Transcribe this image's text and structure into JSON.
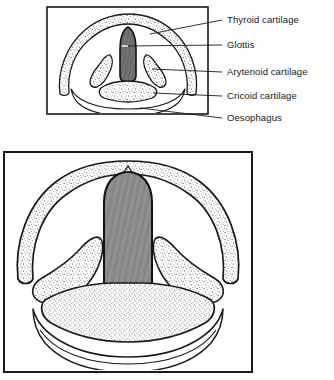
{
  "figure": {
    "background_color": "#ffffff",
    "ink_color": "#1a1a1a",
    "panels": [
      {
        "name": "upper-panel",
        "caption": "small cross-section of larynx with labels",
        "frame": {
          "x": 47,
          "y": 7,
          "width": 161,
          "height": 107
        }
      },
      {
        "name": "lower-panel",
        "caption": "enlarged cross-section of larynx",
        "frame": {
          "x": 4,
          "y": 152,
          "width": 248,
          "height": 220
        }
      }
    ],
    "labels": [
      {
        "id": "thyroid",
        "text": "Thyroid cartilage",
        "x": 227,
        "y": 23,
        "leader_y": 20,
        "leader_to_x": 150,
        "leader_to_y": 34
      },
      {
        "id": "glottis",
        "text": "Glottis",
        "x": 227,
        "y": 48,
        "leader_y": 45,
        "leader_to_x": 127,
        "leader_to_y": 46
      },
      {
        "id": "arytenoid",
        "text": "Arytenoid cartilage",
        "x": 227,
        "y": 75,
        "leader_y": 72,
        "leader_to_x": 152,
        "leader_to_y": 69
      },
      {
        "id": "cricoid",
        "text": "Cricoid cartilage",
        "x": 227,
        "y": 99,
        "leader_y": 96,
        "leader_to_x": 153,
        "leader_to_y": 93
      },
      {
        "id": "oesophagus",
        "text": "Oesophagus",
        "x": 227,
        "y": 121,
        "leader_y": 118,
        "leader_to_x": 140,
        "leader_to_y": 108
      }
    ],
    "structures": {
      "thyroid_cartilage": {
        "label": "Thyroid cartilage",
        "fill": "stipple",
        "outline": "#1a1a1a"
      },
      "glottis": {
        "label": "Glottis",
        "fill": "#8a8a8a",
        "texture": "striations",
        "outline": "#111111"
      },
      "arytenoid_cartilage": {
        "label": "Arytenoid cartilage",
        "fill": "stipple",
        "outline": "#1a1a1a"
      },
      "cricoid_cartilage": {
        "label": "Cricoid cartilage",
        "fill": "stipple",
        "outline": "#1a1a1a"
      },
      "oesophagus": {
        "label": "Oesophagus",
        "fill": "#ffffff",
        "outline": "#1a1a1a"
      }
    }
  }
}
